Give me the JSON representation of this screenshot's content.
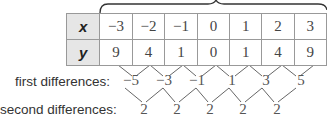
{
  "table": {
    "rows": [
      {
        "label": "x",
        "values": [
          "−3",
          "−2",
          "−1",
          "0",
          "1",
          "2",
          "3"
        ]
      },
      {
        "label": "y",
        "values": [
          "9",
          "4",
          "1",
          "0",
          "1",
          "4",
          "9"
        ]
      }
    ]
  },
  "first_differences": {
    "label": "first differences:",
    "values": [
      "−5",
      "−3",
      "−1",
      "1",
      "3",
      "5"
    ]
  },
  "second_differences": {
    "label": "second differences:",
    "values": [
      "2",
      "2",
      "2",
      "2",
      "2"
    ]
  }
}
